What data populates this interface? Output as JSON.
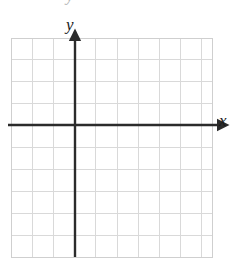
{
  "figure": {
    "kind": "blank-cartesian-coordinate-grid",
    "width": 234,
    "height": 268,
    "background_color": "#ffffff"
  },
  "chart_data": {
    "type": "scatter",
    "title": "",
    "subtitle": "",
    "xlabel": "x",
    "ylabel": "y",
    "series": [
      {
        "name": "",
        "x": [],
        "y": []
      }
    ],
    "x": [],
    "values": [],
    "categories": [],
    "xlim": [
      -3,
      6.5
    ],
    "ylim": [
      -6,
      4
    ],
    "xticks": [],
    "yticks": [],
    "xtick_labels": [],
    "ytick_labels": [],
    "grid": true,
    "grid_columns": 10,
    "grid_rows": 10,
    "legend": false,
    "legend_position": "none",
    "annotations": []
  },
  "grid": {
    "line_color": "#d9d9d9",
    "border_color": "#cfcfcf",
    "left": 11,
    "top": 38,
    "right": 212,
    "bottom": 257,
    "cell_width": 21.2,
    "cell_height": 21.9,
    "columns": 10,
    "rows": 10,
    "vertical_lines": [
      11,
      32.2,
      53.4,
      74.6,
      95.8,
      117,
      138.2,
      159.4,
      180.6,
      201.8,
      212
    ],
    "horizontal_lines": [
      38,
      59.9,
      81.8,
      103.7,
      125.6,
      147.5,
      169.4,
      191.3,
      213.2,
      235.1,
      257
    ]
  },
  "axes": {
    "color": "#2b2b2b",
    "stroke_width": 2.4,
    "origin_x": 75,
    "origin_y": 125,
    "x_axis": {
      "label": "x",
      "label_x": 222,
      "label_y": 122,
      "start_x": 8,
      "end_x": 218,
      "y": 125,
      "arrow_start": false,
      "arrow_end": true
    },
    "y_axis": {
      "label": "y",
      "label_x": 72,
      "label_y": 27,
      "start_y": 257,
      "end_y": 40,
      "x": 75,
      "arrow_start": false,
      "arrow_end": true
    }
  },
  "artifacts": {
    "top_clipped_glyph": "y"
  }
}
